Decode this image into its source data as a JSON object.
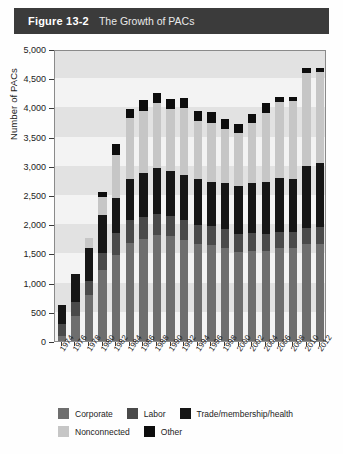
{
  "figure": {
    "number": "Figure 13-2",
    "title": "The Growth of PACs"
  },
  "chart_data": {
    "type": "bar",
    "subtype": "stacked-vertical",
    "title": "The Growth of PACs",
    "xlabel": "",
    "ylabel": "Number of PACs",
    "ylim": [
      0,
      5000
    ],
    "ytick_step": 500,
    "ytick_labels": [
      "0",
      "500",
      "1,000",
      "1,500",
      "2,000",
      "2,500",
      "3,000",
      "3,500",
      "4,000",
      "4,500",
      "5,000"
    ],
    "ytick_values": [
      0,
      500,
      1000,
      1500,
      2000,
      2500,
      3000,
      3500,
      4000,
      4500,
      5000
    ],
    "grid": "horizontal-bands",
    "legend_position": "bottom",
    "categories": [
      "1974",
      "1976",
      "1978",
      "1980",
      "1982",
      "1984",
      "1986",
      "1988",
      "1990",
      "1992",
      "1994",
      "1996",
      "1998",
      "2000",
      "2002",
      "2004",
      "2006",
      "2008",
      "2010",
      "2012"
    ],
    "series": [
      {
        "name": "Corporate",
        "color": "#6e6e6e",
        "values": [
          90,
          430,
          790,
          1210,
          1470,
          1680,
          1740,
          1820,
          1795,
          1735,
          1660,
          1642,
          1597,
          1523,
          1538,
          1538,
          1598,
          1598,
          1661,
          1661
        ]
      },
      {
        "name": "Labor",
        "color": "#4a4a4a",
        "values": [
          200,
          230,
          230,
          300,
          380,
          390,
          390,
          350,
          345,
          345,
          330,
          332,
          327,
          317,
          307,
          301,
          273,
          272,
          272,
          298
        ]
      },
      {
        "name": "Trade/membership/health",
        "color": "#161616",
        "values": [
          320,
          490,
          580,
          640,
          600,
          700,
          740,
          790,
          770,
          770,
          790,
          745,
          780,
          812,
          857,
          880,
          921,
          906,
          1065,
          1092
        ]
      },
      {
        "name": "Nonconnected",
        "color": "#c6c6c6",
        "values": [
          0,
          0,
          160,
          310,
          740,
          1053,
          1077,
          1115,
          1062,
          1145,
          980,
          1020,
          935,
          902,
          1024,
          1192,
          1304,
          1327,
          1600,
          1554
        ]
      },
      {
        "name": "Other",
        "color": "#0d0d0d",
        "values": [
          0,
          0,
          0,
          90,
          180,
          150,
          180,
          180,
          175,
          170,
          175,
          175,
          170,
          168,
          168,
          170,
          76,
          78,
          72,
          75
        ]
      }
    ],
    "totals": [
      610,
      1150,
      1760,
      2550,
      3370,
      3973,
      4127,
      4255,
      4147,
      4165,
      3935,
      3914,
      3809,
      3722,
      3894,
      4081,
      4172,
      4181,
      4670,
      4680
    ]
  },
  "legend": {
    "rows": [
      [
        {
          "label": "Corporate",
          "color": "#6e6e6e",
          "swatch_name": "legend-swatch-corporate"
        },
        {
          "label": "Labor",
          "color": "#4a4a4a",
          "swatch_name": "legend-swatch-labor"
        },
        {
          "label": "Trade/membership/health",
          "color": "#161616",
          "swatch_name": "legend-swatch-trade"
        }
      ],
      [
        {
          "label": "Nonconnected",
          "color": "#c6c6c6",
          "swatch_name": "legend-swatch-nonconnected"
        },
        {
          "label": "Other",
          "color": "#0d0d0d",
          "swatch_name": "legend-swatch-other"
        }
      ]
    ]
  },
  "style": {
    "titlebar_bg": "#3b3b3b",
    "plot_bg": "#f3f3f3",
    "band_color": "#e2e2e2",
    "axis_color": "#8a8a8a",
    "text_color": "#1c1c1c"
  }
}
